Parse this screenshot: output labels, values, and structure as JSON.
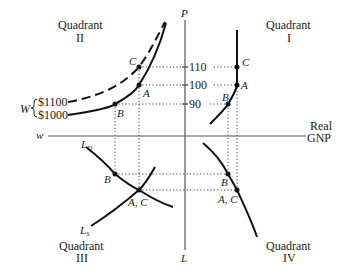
{
  "diagram": {
    "quadrants": {
      "q1": {
        "title": "Quadrant",
        "numeral": "I"
      },
      "q2": {
        "title": "Quadrant",
        "numeral": "II"
      },
      "q3": {
        "title": "Quadrant",
        "numeral": "III"
      },
      "q4": {
        "title": "Quadrant",
        "numeral": "IV"
      }
    },
    "axes": {
      "vertical_top": "P",
      "vertical_bottom": "L",
      "horizontal_left": "w",
      "horizontal_right_line1": "Real",
      "horizontal_right_line2": "GNP"
    },
    "price_ticks": [
      "110",
      "100",
      "90"
    ],
    "wage_bracket": {
      "label": "W",
      "upper": "$1100",
      "lower": "$1000"
    },
    "curves": {
      "labor_demand": "L",
      "labor_demand_sub": "D",
      "labor_supply": "L",
      "labor_supply_sub": "S"
    },
    "points": {
      "q1": {
        "c": "C",
        "a": "A",
        "b": "B"
      },
      "q2": {
        "c": "C",
        "a": "A",
        "b": "B"
      },
      "q3": {
        "b": "B",
        "ac": "A, C"
      },
      "q4": {
        "b": "B",
        "ac": "A, C"
      }
    }
  }
}
